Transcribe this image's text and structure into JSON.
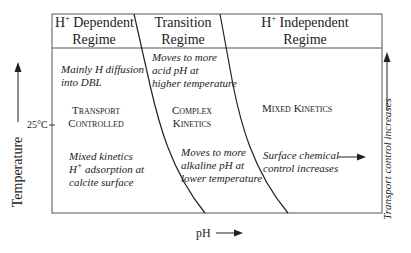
{
  "headers": {
    "h_dependent": {
      "prefix": "H",
      "sup": "+",
      "line1_rest": " Dependent",
      "line2": "Regime"
    },
    "transition": {
      "line1": "Transition",
      "line2": "Regime"
    },
    "h_independent": {
      "prefix": "H",
      "sup": "+",
      "line1_rest": " Independent",
      "line2": "Regime"
    }
  },
  "regions": {
    "left_top": [
      "Mainly H diffusion",
      "into DBL"
    ],
    "left_mid": [
      "Transport",
      "Controlled"
    ],
    "left_bottom": {
      "line1": "Mixed kinetics",
      "line2_prefix": "H",
      "line2_sup": "+",
      "line2_rest": " adsorption at",
      "line3": "calcite surface"
    },
    "mid_top": [
      "Moves to more",
      "acid pH at",
      "higher temperature"
    ],
    "mid_mid": [
      "Complex",
      "Kinetics"
    ],
    "mid_bottom": [
      "Moves to more",
      "alkaline pH at",
      "lower temperature"
    ],
    "right_mid": "Mixed Kinetics",
    "right_bottom": [
      "Surface chemical",
      "control increases"
    ]
  },
  "axes": {
    "y_label": "Temperature",
    "y_tick": "25°C",
    "x_label": "pH",
    "right_label": "Transport control increases"
  },
  "colors": {
    "line": "#222222",
    "text": "#222222",
    "frame": "#555555"
  }
}
